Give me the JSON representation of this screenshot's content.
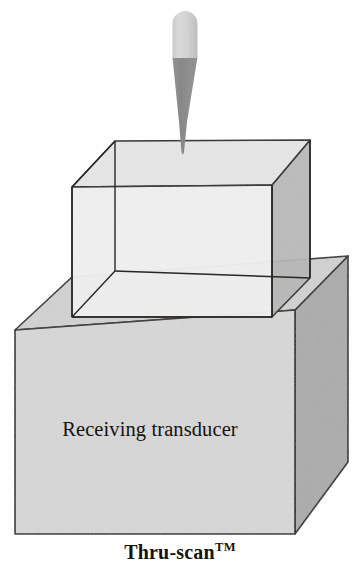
{
  "figure": {
    "caption": "Thru-scan",
    "caption_trademark": "TM",
    "alt_title": "Thru-scan ultrasonic inspection schematic",
    "labels": {
      "receiving_transducer": "Receiving transducer"
    },
    "parts": [
      {
        "name": "transmitting-probe",
        "label": "",
        "description": "cylindrical probe body with tapered cone beam"
      },
      {
        "name": "specimen-block",
        "label": "",
        "description": "transparent rectangular specimen block with visible hidden edges"
      },
      {
        "name": "receiving-transducer-block",
        "label": "Receiving transducer",
        "description": "opaque shaded block beneath the specimen"
      }
    ],
    "colors": {
      "background": "#ffffff",
      "outline": "#2a2622",
      "probe_body": "#d3d3d3",
      "probe_body_edge": "#bdbdbd",
      "probe_cone": "#8a8a8a",
      "specimen_top": "#e4e4e4",
      "specimen_front": "#efefef",
      "specimen_right": "#b6b6b6",
      "transducer_top": "#d2d2d2",
      "transducer_front": "#d7d7d7",
      "transducer_right": "#ababab",
      "text": "#16120f"
    }
  }
}
